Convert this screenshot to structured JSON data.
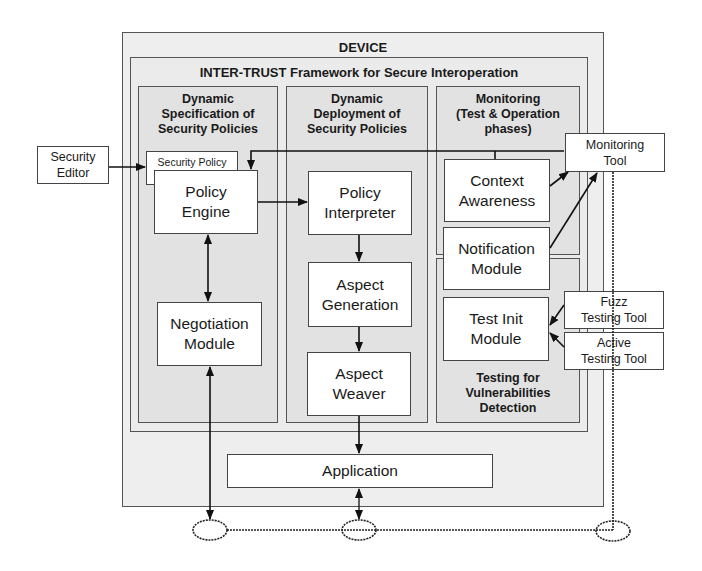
{
  "device": {
    "title": "DEVICE"
  },
  "framework": {
    "title": "INTER-TRUST Framework for Secure Interoperation"
  },
  "columns": [
    {
      "title": "Dynamic\nSpecification of\nSecurity Policies"
    },
    {
      "title": "Dynamic\nDeployment of\nSecurity Policies"
    },
    {
      "title": "Monitoring\n(Test & Operation\nphases)"
    }
  ],
  "testing_section": {
    "title": "Testing for\nVulnerabilities\nDetection"
  },
  "components": {
    "security_policy": "Security Policy",
    "policy_engine": "Policy\nEngine",
    "negotiation_module": "Negotiation\nModule",
    "policy_interpreter": "Policy\nInterpreter",
    "aspect_generation": "Aspect\nGeneration",
    "aspect_weaver": "Aspect\nWeaver",
    "context_awareness": "Context\nAwareness",
    "notification_module": "Notification\nModule",
    "test_init_module": "Test Init\nModule",
    "application": "Application"
  },
  "external": {
    "security_editor": "Security\nEditor",
    "monitoring_tool": "Monitoring\nTool",
    "fuzz_testing_tool": "Fuzz\nTesting Tool",
    "active_testing_tool": "Active\nTesting Tool"
  },
  "colors": {
    "device_bg": "#eeeeee",
    "column_bg": "#e2e2e2",
    "line": "#222222",
    "box_bg": "#ffffff"
  }
}
